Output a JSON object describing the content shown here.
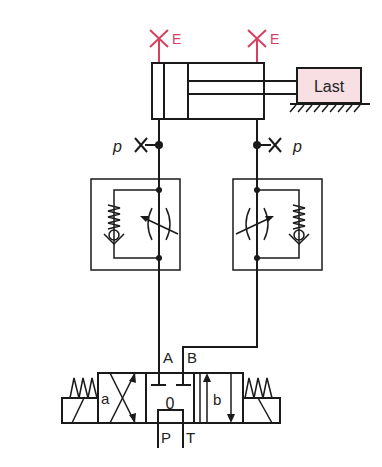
{
  "diagram": {
    "type": "hydraulic-circuit",
    "cylinder": {
      "label": "double-acting cylinder",
      "vent_left_label": "E",
      "vent_right_label": "E"
    },
    "load": {
      "label": "Last",
      "fill": "#f7dfe3"
    },
    "gauges": {
      "left_label": "p",
      "right_label": "p"
    },
    "flow_control_valves": [
      {
        "name": "left",
        "description": "throttle check valve"
      },
      {
        "name": "right",
        "description": "throttle check valve"
      }
    ],
    "directional_valve": {
      "position_a_label": "a",
      "position_0_label": "0",
      "position_b_label": "b",
      "port_a": "A",
      "port_b": "B",
      "port_p": "P",
      "port_t": "T"
    },
    "colors": {
      "line": "#1a1a1a",
      "vent": "#d6405e",
      "load_fill": "#f7dfe3"
    }
  }
}
